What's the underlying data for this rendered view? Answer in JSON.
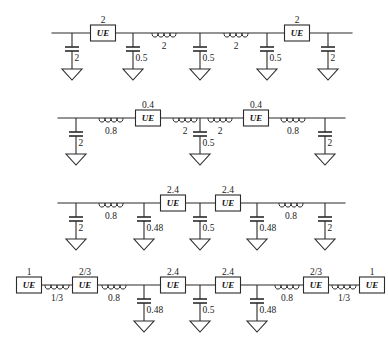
{
  "figure": {
    "background_color": "#ffffff",
    "line_color": "#2b2b2b",
    "element_label": "UE",
    "rows": [
      {
        "id": "row-1",
        "baseline_y": 33,
        "wire_x1": 52,
        "wire_x2": 352,
        "ue": [
          {
            "label": "UE",
            "value": "2",
            "cx": 103
          },
          {
            "label": "UE",
            "value": "2",
            "cx": 297
          }
        ],
        "inductors": [
          {
            "value": "2",
            "cx": 164
          },
          {
            "value": "2",
            "cx": 236
          }
        ],
        "capacitors": [
          {
            "value": "2",
            "cx": 72
          },
          {
            "value": "0.5",
            "cx": 133
          },
          {
            "value": "0.5",
            "cx": 200
          },
          {
            "value": "0.5",
            "cx": 267
          },
          {
            "value": "2",
            "cx": 328
          }
        ]
      },
      {
        "id": "row-2",
        "baseline_y": 118,
        "wire_x1": 58,
        "wire_x2": 345,
        "ue": [
          {
            "label": "UE",
            "value": "0.4",
            "cx": 148
          },
          {
            "label": "UE",
            "value": "0.4",
            "cx": 256
          }
        ],
        "inductors": [
          {
            "value": "0.8",
            "cx": 111
          },
          {
            "value": "2",
            "cx": 185
          },
          {
            "value": "2",
            "cx": 220
          },
          {
            "value": "0.8",
            "cx": 293
          }
        ],
        "capacitors": [
          {
            "value": "2",
            "cx": 76
          },
          {
            "value": "0.5",
            "cx": 200
          },
          {
            "value": "2",
            "cx": 325
          }
        ]
      },
      {
        "id": "row-3",
        "baseline_y": 203,
        "wire_x1": 58,
        "wire_x2": 345,
        "ue": [
          {
            "label": "UE",
            "value": "2.4",
            "cx": 173
          },
          {
            "label": "UE",
            "value": "2.4",
            "cx": 228
          }
        ],
        "inductors": [
          {
            "value": "0.8",
            "cx": 111
          },
          {
            "value": "0.8",
            "cx": 291
          }
        ],
        "capacitors": [
          {
            "value": "2",
            "cx": 76
          },
          {
            "value": "0.48",
            "cx": 144
          },
          {
            "value": "0.5",
            "cx": 200
          },
          {
            "value": "0.48",
            "cx": 257
          },
          {
            "value": "2",
            "cx": 325
          }
        ]
      },
      {
        "id": "row-4",
        "baseline_y": 285,
        "wire_x1": 17,
        "wire_x2": 372,
        "ue": [
          {
            "label": "UE",
            "value": "1",
            "cx": 29
          },
          {
            "label": "UE",
            "value": "2/3",
            "cx": 85
          },
          {
            "label": "UE",
            "value": "2.4",
            "cx": 173
          },
          {
            "label": "UE",
            "value": "2.4",
            "cx": 228
          },
          {
            "label": "UE",
            "value": "2/3",
            "cx": 316
          },
          {
            "label": "UE",
            "value": "1",
            "cx": 372
          }
        ],
        "inductors": [
          {
            "value": "1/3",
            "cx": 57
          },
          {
            "value": "0.8",
            "cx": 114
          },
          {
            "value": "0.8",
            "cx": 287
          },
          {
            "value": "1/3",
            "cx": 344
          }
        ],
        "capacitors": [
          {
            "value": "0.48",
            "cx": 144
          },
          {
            "value": "0.5",
            "cx": 200
          },
          {
            "value": "0.48",
            "cx": 257
          }
        ]
      }
    ]
  }
}
